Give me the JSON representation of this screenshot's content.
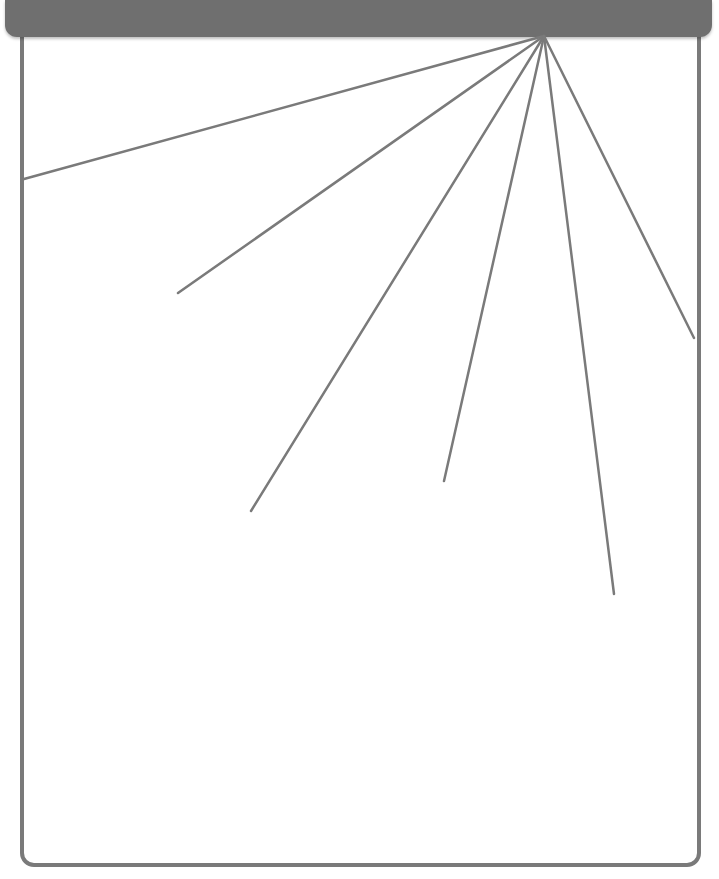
{
  "colors": {
    "header": "#6f6f6f",
    "frame_border": "#7a7a7a",
    "ray": "#7a7a7a",
    "background": "#ffffff"
  },
  "diagram": {
    "type": "radiating-lines",
    "origin": [
      544,
      36
    ],
    "rays": [
      {
        "end": [
          24,
          179
        ]
      },
      {
        "end": [
          178,
          293
        ]
      },
      {
        "end": [
          251,
          511
        ]
      },
      {
        "end": [
          444,
          481
        ]
      },
      {
        "end": [
          614,
          594
        ]
      },
      {
        "end": [
          694,
          338
        ]
      }
    ]
  }
}
